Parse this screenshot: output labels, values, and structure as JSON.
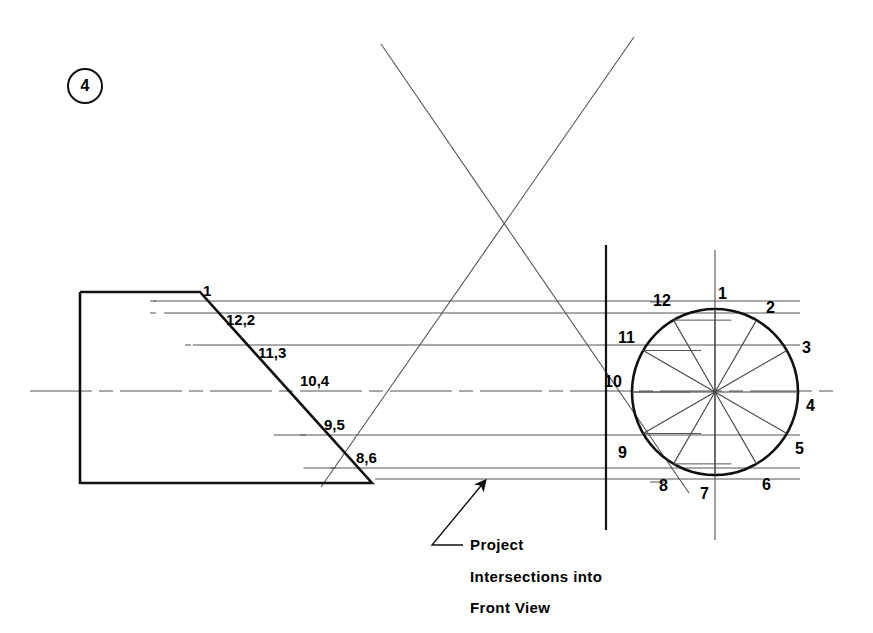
{
  "page": {
    "background_color": "#ffffff",
    "line_color": "#222222",
    "width": 873,
    "height": 633
  },
  "figure_tag": {
    "name": "figure-number-badge",
    "label": "4",
    "cx": 85,
    "cy": 86,
    "r": 18
  },
  "front_view": {
    "name": "front-view-profile",
    "description": "Chamfered block outline in front view",
    "outline_points": "80,292 200,292 372,483 80,483 80,292",
    "element_labels": [
      {
        "text": "1",
        "x": 203,
        "y": 283,
        "element": "projection-label-1"
      },
      {
        "text": "12,2",
        "x": 226,
        "y": 312,
        "element": "projection-label-12-2"
      },
      {
        "text": "11,3",
        "x": 258,
        "y": 345,
        "element": "projection-label-11-3"
      },
      {
        "text": "10,4",
        "x": 300,
        "y": 373,
        "element": "projection-label-10-4"
      },
      {
        "text": "9,5",
        "x": 324,
        "y": 417,
        "element": "projection-label-9-5"
      },
      {
        "text": "8,6",
        "x": 356,
        "y": 450,
        "element": "projection-label-8-6"
      }
    ]
  },
  "side_view": {
    "name": "side-view-circle",
    "center_x": 715,
    "center_y": 392,
    "radius": 83,
    "divisions": 12,
    "reference_line_x": 606,
    "reference_line_y_top": 245,
    "reference_line_y_bottom": 530,
    "vertical_centerline_y_top": 250,
    "vertical_centerline_y_bottom": 540,
    "division_labels": [
      {
        "text": "1",
        "x": 718,
        "y": 286,
        "element": "circle-point-1"
      },
      {
        "text": "2",
        "x": 766,
        "y": 300,
        "element": "circle-point-2"
      },
      {
        "text": "3",
        "x": 802,
        "y": 340,
        "element": "circle-point-3"
      },
      {
        "text": "4",
        "x": 806,
        "y": 398,
        "element": "circle-point-4"
      },
      {
        "text": "5",
        "x": 795,
        "y": 441,
        "element": "circle-point-5"
      },
      {
        "text": "6",
        "x": 762,
        "y": 477,
        "element": "circle-point-6"
      },
      {
        "text": "7",
        "x": 700,
        "y": 486,
        "element": "circle-point-7"
      },
      {
        "text": "8",
        "x": 659,
        "y": 478,
        "element": "circle-point-8"
      },
      {
        "text": "9",
        "x": 618,
        "y": 445,
        "element": "circle-point-9"
      },
      {
        "text": "10",
        "x": 604,
        "y": 374,
        "element": "circle-point-10"
      },
      {
        "text": "11",
        "x": 618,
        "y": 330,
        "element": "circle-point-11"
      },
      {
        "text": "12",
        "x": 653,
        "y": 293,
        "element": "circle-point-12"
      }
    ]
  },
  "projection_lines": {
    "name": "horizontal-projection-lines",
    "y_values": [
      301,
      313,
      345,
      392,
      435,
      468,
      479
    ]
  },
  "centerline": {
    "name": "horizontal-centerline",
    "y": 391,
    "x_start": 30,
    "x_end": 840
  },
  "construction_lines": {
    "name": "auxiliary-construction-cross",
    "line_a": {
      "x1": 381,
      "y1": 44,
      "x2": 689,
      "y2": 493
    },
    "line_b": {
      "x1": 634,
      "y1": 37,
      "x2": 321,
      "y2": 487
    }
  },
  "annotation": {
    "name": "project-intersections-note",
    "lines": [
      {
        "text": "Project",
        "x": 470,
        "y": 537
      },
      {
        "text": "Intersections  into",
        "x": 470,
        "y": 569
      },
      {
        "text": "Front View",
        "x": 470,
        "y": 600
      }
    ],
    "leader": {
      "elbow_x": 432,
      "elbow_y": 545,
      "bend_x": 463,
      "bend_y": 545,
      "tip_x": 485,
      "tip_y": 481
    }
  }
}
